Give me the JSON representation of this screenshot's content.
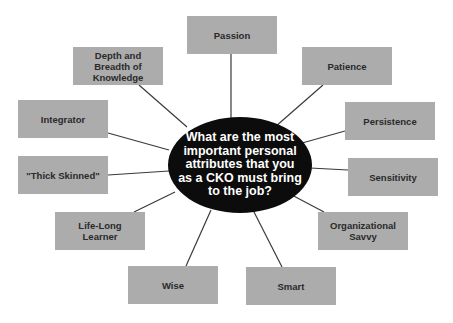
{
  "diagram": {
    "type": "mind-map",
    "center": {
      "text": "What are the most important personal attributes that you as a CKO must bring to the job?",
      "fill": "#0c0c0c",
      "text_color": "#ffffff"
    },
    "box_fill": "#acacac",
    "line_color": "#3a3a3a",
    "nodes": [
      {
        "label": "Passion"
      },
      {
        "label": "Patience"
      },
      {
        "label": "Persistence"
      },
      {
        "label": "Sensitivity"
      },
      {
        "label": "Organizational Savvy"
      },
      {
        "label": "Smart"
      },
      {
        "label": "Wise"
      },
      {
        "label": "Life-Long Learner"
      },
      {
        "label": "\"Thick Skinned\""
      },
      {
        "label": "Integrator"
      },
      {
        "label": "Depth and Breadth of Knowledge"
      }
    ]
  }
}
